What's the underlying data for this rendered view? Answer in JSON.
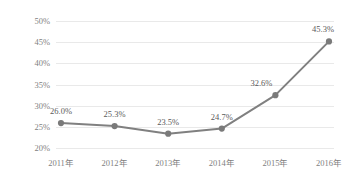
{
  "chart_data": {
    "type": "line",
    "title": "",
    "subtitle": "",
    "xlabel": "",
    "ylabel": "",
    "categories": [
      "2011年",
      "2012年",
      "2013年",
      "2014年",
      "2015年",
      "2016年"
    ],
    "values": [
      26.0,
      25.3,
      23.5,
      24.7,
      32.6,
      45.3
    ],
    "point_labels": [
      "26.0%",
      "25.3%",
      "23.5%",
      "24.7%",
      "32.6%",
      "45.3%"
    ],
    "ylim": [
      20,
      50
    ],
    "ytick_values": [
      20,
      25,
      30,
      35,
      40,
      45,
      50
    ],
    "ytick_labels": [
      "20%",
      "25%",
      "30%",
      "35%",
      "40%",
      "45%",
      "50%"
    ],
    "grid": true,
    "grid_axis": "y",
    "legend": false,
    "legend_position": "none",
    "series": [
      {
        "name": "",
        "values": [
          26.0,
          25.3,
          23.5,
          24.7,
          32.6,
          45.3
        ]
      }
    ]
  },
  "style": {
    "background_color": "#ffffff",
    "line_color": "#808080",
    "marker_color": "#7a7a7a",
    "grid_color": "#e9e9e9",
    "axis_label_color": "#7f7f7f",
    "data_label_color": "#5a5a5a"
  }
}
